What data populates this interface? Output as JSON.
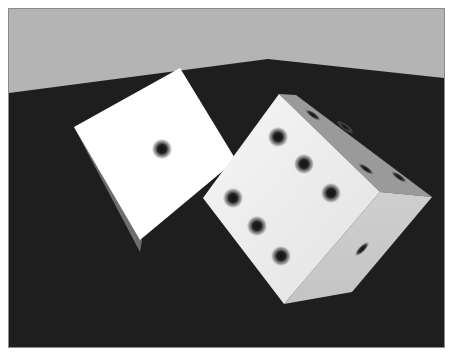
{
  "image": {
    "description": "Rendered 3D scene of two white dice on a dark floor against a light gray wall",
    "colors": {
      "wall": "#b4b4b4",
      "floor": "#1e1e1e",
      "frame": "#8c8c8c",
      "die_face_bright": "#ffffff",
      "die_face_mid": "#d2d2d2",
      "die_face_dark": "#7a7a7a",
      "pip": "#1a1a1a"
    },
    "objects": [
      {
        "name": "left-die",
        "visible_faces": [
          {
            "face": "front",
            "pips": 1
          },
          {
            "face": "side",
            "pips": 0
          }
        ]
      },
      {
        "name": "right-die",
        "visible_faces": [
          {
            "face": "front",
            "pips": 6
          },
          {
            "face": "top",
            "pips": 4
          },
          {
            "face": "right",
            "pips": 1
          }
        ]
      }
    ]
  }
}
